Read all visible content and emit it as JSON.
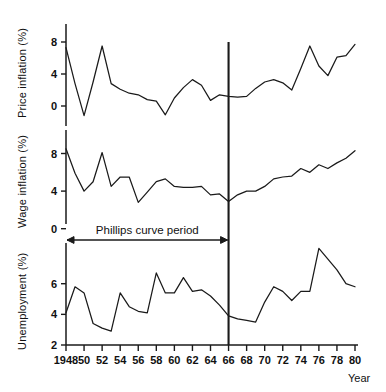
{
  "figure": {
    "xaxis_title": "Year",
    "annotation": "Phillips curve period",
    "panels": [
      {
        "name": "price",
        "ylabel": "Price inflation (%)"
      },
      {
        "name": "wage",
        "ylabel": "Wage inflation (%)"
      },
      {
        "name": "unemployment",
        "ylabel": "Unemployment (%)"
      }
    ],
    "x_tick_labels": [
      "1948",
      "50",
      "52",
      "54",
      "56",
      "58",
      "60",
      "62",
      "64",
      "66",
      "68",
      "70",
      "72",
      "74",
      "76",
      "78",
      "80"
    ],
    "divider_year": 1966,
    "line_color": "#1a1a1a"
  },
  "chart_data": [
    {
      "type": "line",
      "title": "Price inflation (%)",
      "xlabel": "Year",
      "ylabel": "Price inflation (%)",
      "xlim": [
        1948,
        1980
      ],
      "ylim": [
        -2.5,
        11.0
      ],
      "yticks": [
        0,
        4,
        8
      ],
      "ytick_labels": [
        "0",
        "4",
        "8"
      ],
      "grid": false,
      "legend": "none",
      "x": [
        1948,
        1949,
        1950,
        1951,
        1952,
        1953,
        1954,
        1955,
        1956,
        1957,
        1958,
        1959,
        1960,
        1961,
        1962,
        1963,
        1964,
        1965,
        1966,
        1967,
        1968,
        1969,
        1970,
        1971,
        1972,
        1973,
        1974,
        1975,
        1976,
        1977,
        1978,
        1979,
        1980
      ],
      "values": [
        7.3,
        2.8,
        -1.2,
        3.0,
        7.5,
        2.8,
        2.1,
        1.6,
        1.4,
        0.8,
        0.6,
        -1.1,
        1.0,
        2.3,
        3.3,
        2.6,
        0.7,
        1.4,
        1.2,
        1.1,
        1.2,
        2.2,
        3.0,
        3.3,
        2.9,
        2.0,
        4.7,
        7.5,
        5.0,
        3.8,
        6.1,
        6.3,
        7.7,
        10.5
      ]
    },
    {
      "type": "line",
      "title": "Wage inflation (%)",
      "xlabel": "Year",
      "ylabel": "Wage inflation (%)",
      "xlim": [
        1948,
        1980
      ],
      "ylim": [
        0.5,
        10.5
      ],
      "yticks": [
        0,
        4,
        8
      ],
      "ytick_labels": [
        "0",
        "4",
        "8"
      ],
      "grid": false,
      "legend": "none",
      "x": [
        1948,
        1949,
        1950,
        1951,
        1952,
        1953,
        1954,
        1955,
        1956,
        1957,
        1958,
        1959,
        1960,
        1961,
        1962,
        1963,
        1964,
        1965,
        1966,
        1967,
        1968,
        1969,
        1970,
        1971,
        1972,
        1973,
        1974,
        1975,
        1976,
        1977,
        1978,
        1979,
        1980
      ],
      "values": [
        8.5,
        5.9,
        4.0,
        5.0,
        8.1,
        4.5,
        5.5,
        5.5,
        2.8,
        3.9,
        5.0,
        5.3,
        4.5,
        4.4,
        4.4,
        4.5,
        3.6,
        3.7,
        2.9,
        3.6,
        4.0,
        4.0,
        4.5,
        5.3,
        5.5,
        5.6,
        6.4,
        6.0,
        6.8,
        6.4,
        7.0,
        7.5,
        8.3,
        8.6
      ]
    },
    {
      "type": "line",
      "title": "Unemployment (%)",
      "xlabel": "Year",
      "ylabel": "Unemployment (%)",
      "xlim": [
        1948,
        1980
      ],
      "ylim": [
        2.0,
        8.2
      ],
      "yticks": [
        2,
        4,
        6
      ],
      "ytick_labels": [
        "2",
        "4",
        "6"
      ],
      "grid": false,
      "legend": "none",
      "x": [
        1948,
        1949,
        1950,
        1951,
        1952,
        1953,
        1954,
        1955,
        1956,
        1957,
        1958,
        1959,
        1960,
        1961,
        1962,
        1963,
        1964,
        1965,
        1966,
        1967,
        1968,
        1969,
        1970,
        1971,
        1972,
        1973,
        1974,
        1975,
        1976,
        1977,
        1978,
        1979,
        1980
      ],
      "values": [
        4.1,
        5.8,
        5.4,
        3.4,
        3.1,
        2.9,
        5.4,
        4.5,
        4.2,
        4.1,
        6.7,
        5.4,
        5.4,
        6.4,
        5.5,
        5.6,
        5.2,
        4.6,
        3.9,
        3.7,
        3.6,
        3.5,
        4.8,
        5.8,
        5.5,
        4.9,
        5.5,
        5.5,
        8.3,
        7.6,
        6.9,
        6.0,
        5.8,
        7.4
      ]
    }
  ]
}
